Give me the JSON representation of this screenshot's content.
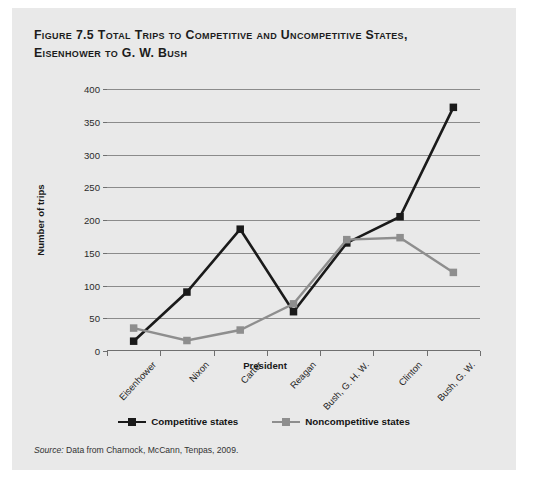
{
  "figure": {
    "title_line1": "Figure 7.5 Total Trips to Competitive and Uncompetitive States,",
    "title_line2": "Eisenhower to G. W. Bush",
    "source_lead": "Source:",
    "source_text": " Data from Charnock, McCann, Tenpas, 2009.",
    "card_background": "#e9e9e9",
    "page_background": "#ffffff"
  },
  "chart_data": {
    "type": "line",
    "title": "Figure 7.5 Total Trips to Competitive and Uncompetitive States, Eisenhower to G. W. Bush",
    "xlabel": "President",
    "ylabel": "Number of trips",
    "categories": [
      "Eisenhower",
      "Nixon",
      "Carter",
      "Reagan",
      "Bush, G. H. W.",
      "Clinton",
      "Bush, G. W."
    ],
    "series": [
      {
        "name": "Competitive states",
        "color": "#1a1a1a",
        "marker": "square",
        "values": [
          15,
          90,
          186,
          60,
          165,
          205,
          372
        ]
      },
      {
        "name": "Noncompetitive states",
        "color": "#8e8e8e",
        "marker": "square",
        "values": [
          35,
          16,
          32,
          72,
          170,
          173,
          120
        ]
      }
    ],
    "ylim": [
      0,
      400
    ],
    "yticks": [
      0,
      50,
      100,
      150,
      200,
      250,
      300,
      350,
      400
    ],
    "ytick_labels": [
      "0",
      "50",
      "100",
      "150",
      "200",
      "250",
      "300",
      "350",
      "400"
    ],
    "grid": true,
    "grid_color": "#8b8b8b",
    "legend_position": "bottom"
  }
}
